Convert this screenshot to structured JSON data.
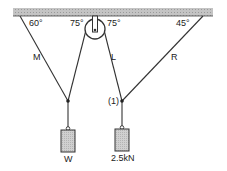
{
  "diagram": {
    "angles": {
      "left_M": "60°",
      "pulley_left": "75°",
      "pulley_right": "75°",
      "right_R": "45°"
    },
    "ropes": {
      "left": "M",
      "middle": "L",
      "right": "R"
    },
    "joint_label": "(1)",
    "weights": {
      "left": "W",
      "right": "2.5kN"
    },
    "colors": {
      "ceiling": "#b8b8b8",
      "rope": "#333333",
      "weight_fill": "#c8c8c8"
    }
  }
}
